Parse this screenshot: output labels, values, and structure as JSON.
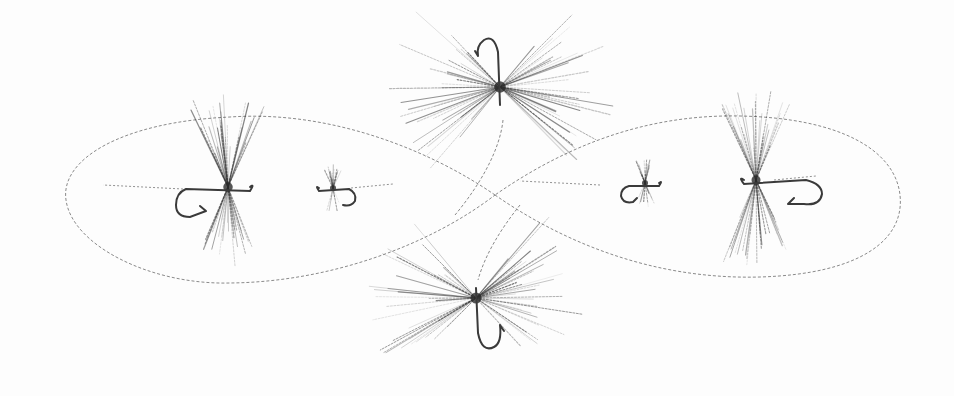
{
  "illustration": {
    "subject": "Pencil drawing of six fishing flies arranged around a figure-eight fishing line",
    "background_color": "#fdfdfd",
    "ink_color": "#2b2b2b",
    "line_color": "#8a8a8a"
  },
  "figure_eight": {
    "left_loop": {
      "cx": 270,
      "cy": 199,
      "rx": 205,
      "ry": 84
    },
    "right_loop": {
      "cx": 710,
      "cy": 197,
      "rx": 192,
      "ry": 81
    },
    "crossing": {
      "x": 495,
      "y": 195
    }
  },
  "flies": [
    {
      "name": "large-dry-fly-left",
      "cx": 228,
      "cy": 187,
      "hackle_r": 95,
      "hackle": "vertical",
      "hook": "left",
      "density": 60
    },
    {
      "name": "small-fly-left",
      "cx": 333,
      "cy": 188,
      "hackle_r": 25,
      "hackle": "vertical",
      "hook": "right",
      "density": 22
    },
    {
      "name": "spider-fly-top",
      "cx": 500,
      "cy": 87,
      "hackle_r": 115,
      "hackle": "horizontal",
      "hook": "up",
      "density": 70
    },
    {
      "name": "spider-fly-bottom",
      "cx": 476,
      "cy": 298,
      "hackle_r": 110,
      "hackle": "horizontal",
      "hook": "down",
      "density": 70
    },
    {
      "name": "small-fly-right",
      "cx": 645,
      "cy": 183,
      "hackle_r": 25,
      "hackle": "vertical",
      "hook": "left",
      "density": 22
    },
    {
      "name": "large-dry-fly-right",
      "cx": 756,
      "cy": 180,
      "hackle_r": 90,
      "hackle": "vertical",
      "hook": "right",
      "density": 60
    }
  ]
}
